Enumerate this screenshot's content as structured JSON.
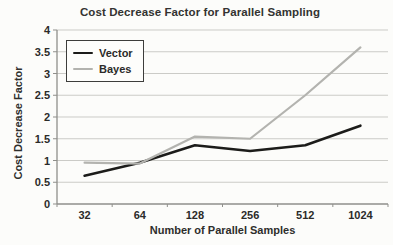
{
  "chart_data": {
    "type": "line",
    "title": "Cost Decrease Factor for Parallel Sampling",
    "xlabel": "Number of Parallel Samples",
    "ylabel": "Cost Decrease Factor",
    "categories": [
      "32",
      "64",
      "128",
      "256",
      "512",
      "1024"
    ],
    "series": [
      {
        "name": "Vector",
        "color": "#1c1c1a",
        "stroke_width": 2.6,
        "values": [
          0.65,
          0.95,
          1.35,
          1.22,
          1.35,
          1.8
        ]
      },
      {
        "name": "Bayes",
        "color": "#b3b3af",
        "stroke_width": 2.2,
        "values": [
          0.95,
          0.93,
          1.55,
          1.5,
          2.5,
          3.6
        ]
      }
    ],
    "ylim": [
      0,
      4
    ],
    "ytick_step": 0.5,
    "ytick_labels": [
      "0",
      "0.5",
      "1",
      "1.5",
      "2",
      "2.5",
      "3",
      "3.5",
      "4"
    ],
    "grid": "horizontal",
    "gridline_color": "#cbcbc7",
    "axis_color": "#8f8f8b",
    "tick_label_color": "#2b2b29",
    "legend_position": "top-left"
  }
}
